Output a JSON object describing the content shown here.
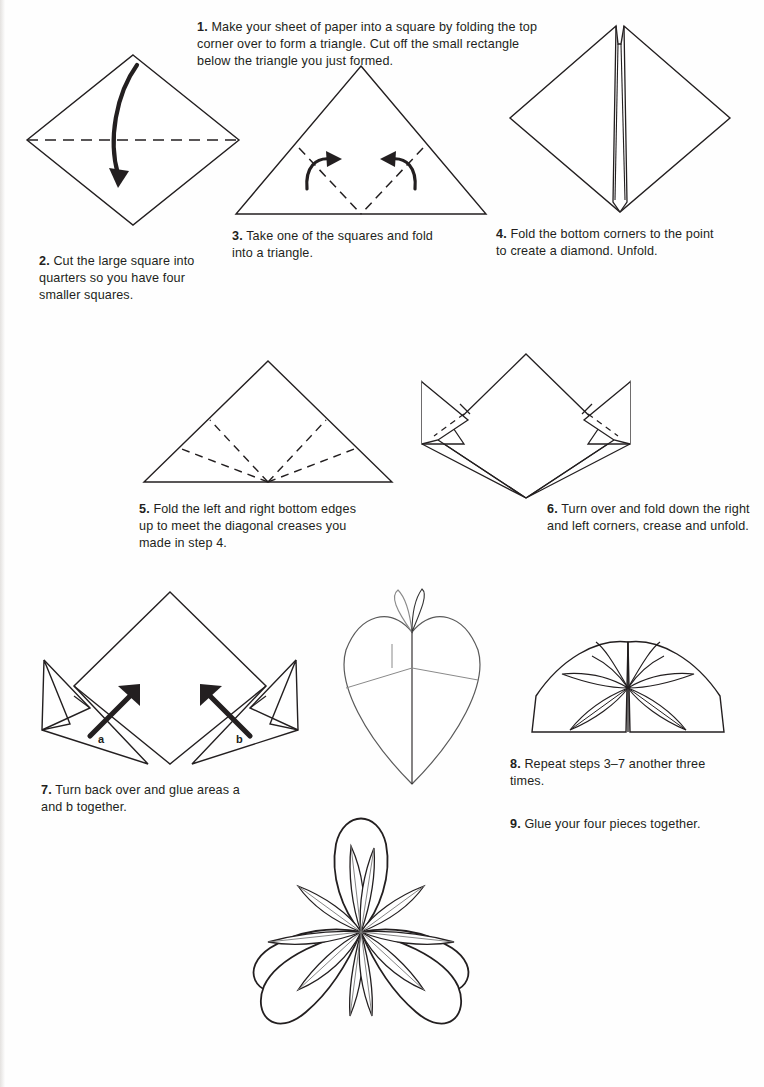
{
  "page": {
    "background_color": "#ffffff",
    "ink_color": "#231f20",
    "width": 764,
    "height": 1087
  },
  "steps": [
    {
      "number": "1.",
      "text": "Make your sheet of paper into a square by folding the top corner over to form a triangle. Cut off the small rectangle below the triangle you just formed.",
      "figure": "square-diamond-with-fold-arrow"
    },
    {
      "number": "2.",
      "text": "Cut the large square into quarters so you have four smaller squares.",
      "figure": "square-diamond-with-fold-arrow"
    },
    {
      "number": "3.",
      "text": "Take one of the squares and fold into a triangle.",
      "figure": "triangle-with-two-fold-arrows"
    },
    {
      "number": "4.",
      "text": "Fold the bottom corners to the point to create a diamond. Unfold.",
      "figure": "diamond-with-center-slit"
    },
    {
      "number": "5.",
      "text": "Fold the left and right bottom edges up to meet the diagonal creases you made in step 4.",
      "figure": "triangle-with-four-creases"
    },
    {
      "number": "6.",
      "text": "Turn over and fold down the right and left corners, crease and unfold.",
      "figure": "kite-with-side-wings"
    },
    {
      "number": "7.",
      "text": "Turn back over and glue areas a and b together.",
      "figure": "kite-with-glue-arrows"
    },
    {
      "number": "8.",
      "text": "Repeat steps 3–7 another three times.",
      "figure": "two-joined-petals"
    },
    {
      "number": "9.",
      "text": "Glue your four pieces together.",
      "figure": "finished-five-petal-flower"
    }
  ],
  "figure_labels": {
    "glue_area_a": "a",
    "glue_area_b": "b"
  },
  "figures": {
    "step1": "square-diamond-with-fold-arrow",
    "step3": "triangle-with-two-fold-arrows",
    "step4": "diamond-with-center-slit",
    "step5": "triangle-with-four-creases",
    "step6": "kite-with-side-wings",
    "step7": "kite-with-glue-arrows",
    "cone": "single-folded-cone-petal",
    "pair": "two-joined-petals",
    "flower": "finished-five-petal-flower"
  }
}
